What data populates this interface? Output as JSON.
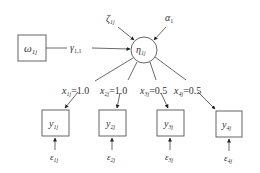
{
  "diagram": {
    "type": "path-diagram",
    "nodes": {
      "omega": {
        "label": "ω",
        "sub": "1j",
        "shape": "box"
      },
      "eta": {
        "label": "η",
        "sub": "1j",
        "shape": "circle"
      },
      "zeta": {
        "label": "ζ",
        "sub": "1j"
      },
      "alpha": {
        "label": "α",
        "sub": "1"
      },
      "y1": {
        "label": "y",
        "sub": "1j",
        "shape": "box"
      },
      "y2": {
        "label": "y",
        "sub": "2j",
        "shape": "box"
      },
      "y3": {
        "label": "y",
        "sub": "3j",
        "shape": "box"
      },
      "y4": {
        "label": "y",
        "sub": "4j",
        "shape": "box"
      },
      "e1": {
        "label": "ε",
        "sub": "1j"
      },
      "e2": {
        "label": "ε",
        "sub": "2j"
      },
      "e3": {
        "label": "ε",
        "sub": "3j"
      },
      "e4": {
        "label": "ε",
        "sub": "4j"
      }
    },
    "edges": {
      "gamma": {
        "label": "γ",
        "sub": "1,1"
      },
      "x1": {
        "label": "x",
        "sub": "1j",
        "value": "=1.0"
      },
      "x2": {
        "label": "x",
        "sub": "2j",
        "value": "=1.0"
      },
      "x3": {
        "label": "x",
        "sub": "3j",
        "value": "=0.5"
      },
      "x4": {
        "label": "x",
        "sub": "4j",
        "value": "=0.5"
      }
    }
  }
}
